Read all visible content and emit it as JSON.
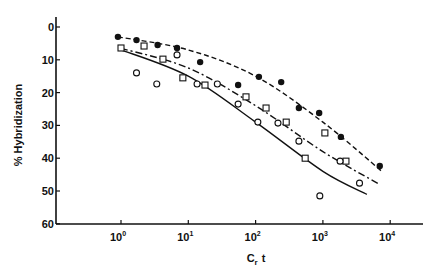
{
  "chart_data": {
    "type": "scatter",
    "title": "",
    "xlabel": "Cr t",
    "xlabel_main": "C",
    "xlabel_sub": "r",
    "xlabel_tail": "t",
    "ylabel": "% Hybridization",
    "xscale": "log",
    "xlim": [
      0.1,
      30000
    ],
    "ylim": [
      0,
      60
    ],
    "y_inverted": true,
    "grid": false,
    "legend": null,
    "x_ticks": [
      1,
      10,
      100,
      1000,
      10000
    ],
    "x_tick_labels": [
      {
        "base": "10",
        "exp": "0"
      },
      {
        "base": "10",
        "exp": "1"
      },
      {
        "base": "10",
        "exp": "2"
      },
      {
        "base": "10",
        "exp": "3"
      },
      {
        "base": "10",
        "exp": "4"
      }
    ],
    "y_ticks": [
      0,
      10,
      20,
      30,
      40,
      50,
      60
    ],
    "y_tick_labels": [
      "0",
      "10",
      "20",
      "30",
      "40",
      "50",
      "60"
    ],
    "series": [
      {
        "name": "filled circles",
        "marker": "filled-circle",
        "line": "dashed",
        "x": [
          0.9,
          1.7,
          3.5,
          6.8,
          15,
          55,
          112,
          240,
          440,
          880,
          1850,
          7000
        ],
        "y": [
          3,
          4,
          5.5,
          6.4,
          10.7,
          17.7,
          15.2,
          16.8,
          24.7,
          26.2,
          33.5,
          42.4
        ],
        "fit": {
          "x": [
            0.9,
            10,
            100,
            1000,
            7500
          ],
          "y": [
            3,
            7,
            15,
            29,
            44
          ]
        }
      },
      {
        "name": "open squares",
        "marker": "open-square",
        "line": "dash-dot",
        "x": [
          1.0,
          2.2,
          4.2,
          8.3,
          17.7,
          72,
          143,
          285,
          545,
          1070,
          2200
        ],
        "y": [
          6.4,
          5.8,
          9.8,
          15.5,
          17.7,
          21.3,
          24.7,
          29,
          40,
          32.3,
          40.9
        ],
        "fit": {
          "x": [
            1.0,
            10,
            100,
            1000,
            7000
          ],
          "y": [
            6.5,
            12.5,
            24,
            38,
            48
          ]
        }
      },
      {
        "name": "open circles",
        "marker": "open-circle",
        "line": "solid",
        "x": [
          1.7,
          3.4,
          6.8,
          13.5,
          27,
          55,
          108,
          215,
          440,
          900,
          1800,
          3500
        ],
        "y": [
          14,
          17.4,
          8.5,
          17.4,
          17.4,
          23.5,
          29,
          29.3,
          34.8,
          51.5,
          40.9,
          47.6
        ],
        "fit": {
          "x": [
            0.95,
            10,
            100,
            1000,
            4500
          ],
          "y": [
            6.8,
            15,
            29,
            44,
            51
          ]
        }
      }
    ]
  }
}
